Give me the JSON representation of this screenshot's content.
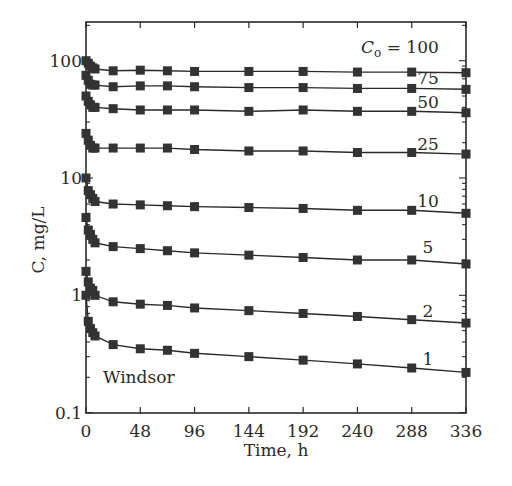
{
  "chart_data": {
    "type": "line",
    "title": "",
    "annotation": "Windsor",
    "legend_prefix": "C",
    "legend_prefix_sub": "o",
    "legend_eq": " = ",
    "xlabel": "Time, h",
    "ylabel": "C, mg/L",
    "xlim": [
      0,
      336
    ],
    "ylim": [
      0.1,
      200
    ],
    "yscale": "log",
    "grid": false,
    "x_ticks": [
      0,
      48,
      96,
      144,
      192,
      240,
      288,
      336
    ],
    "x_tick_labels": [
      "0",
      "48",
      "96",
      "144",
      "192",
      "240",
      "288",
      "336"
    ],
    "y_ticks": [
      0.1,
      1,
      10,
      100
    ],
    "y_tick_labels": [
      "0.1",
      "1",
      "10",
      "100"
    ],
    "x": [
      0,
      2,
      4,
      6,
      8,
      24,
      48,
      72,
      96,
      144,
      192,
      240,
      288,
      336
    ],
    "series": [
      {
        "name": "100",
        "label": "100",
        "values": [
          100,
          95,
          90,
          87,
          85,
          82,
          83,
          82,
          81,
          81,
          81,
          80,
          80,
          79
        ]
      },
      {
        "name": "75",
        "label": "75",
        "values": [
          75,
          68,
          63,
          62,
          62,
          60,
          61,
          61,
          60,
          59,
          59,
          58,
          58,
          57
        ]
      },
      {
        "name": "50",
        "label": "50",
        "values": [
          50,
          45,
          42,
          40,
          40,
          39,
          38,
          38,
          38,
          37,
          38,
          37,
          37,
          36
        ]
      },
      {
        "name": "25",
        "label": "25",
        "values": [
          24,
          21,
          19,
          18,
          18,
          18,
          18,
          18,
          17.5,
          17,
          17,
          16.5,
          16.5,
          16
        ]
      },
      {
        "name": "10",
        "label": "10",
        "values": [
          10,
          7.8,
          7.2,
          6.7,
          6.3,
          6.0,
          5.9,
          5.8,
          5.7,
          5.6,
          5.5,
          5.3,
          5.3,
          5.0
        ]
      },
      {
        "name": "5",
        "label": "5",
        "values": [
          4.6,
          3.6,
          3.3,
          3.0,
          2.8,
          2.6,
          2.5,
          2.4,
          2.3,
          2.2,
          2.1,
          2.0,
          2.0,
          1.85
        ]
      },
      {
        "name": "2",
        "label": "2",
        "values": [
          1.6,
          1.3,
          1.15,
          1.1,
          1.0,
          0.88,
          0.84,
          0.82,
          0.78,
          0.74,
          0.7,
          0.66,
          0.62,
          0.58
        ]
      },
      {
        "name": "1",
        "label": "1",
        "values": [
          1.0,
          0.6,
          0.52,
          0.48,
          0.45,
          0.38,
          0.35,
          0.34,
          0.32,
          0.3,
          0.28,
          0.26,
          0.24,
          0.22
        ]
      }
    ]
  }
}
